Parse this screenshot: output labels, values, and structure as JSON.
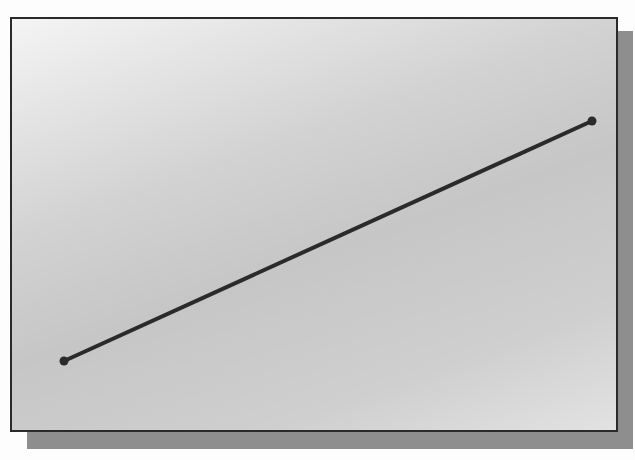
{
  "diagram": {
    "type": "line-segment",
    "canvas": {
      "background_start": "#f4f4f4",
      "background_end": "#c6c6c6",
      "border_color": "#2a2a2a",
      "shadow_color": "#8e8e8e"
    },
    "line": {
      "color": "#2b2b2b",
      "width": 4,
      "start_point": {
        "x": 52,
        "y": 342
      },
      "end_point": {
        "x": 580,
        "y": 102
      },
      "endpoint_radius": 4.5
    }
  }
}
